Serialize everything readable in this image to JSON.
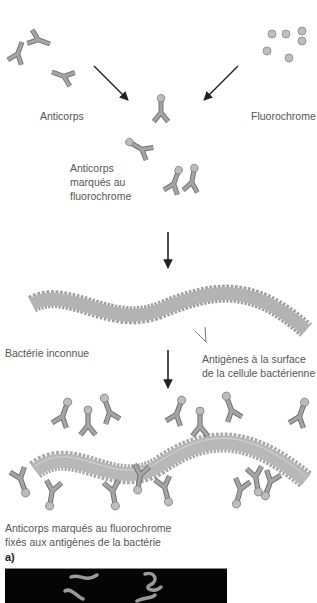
{
  "labels": {
    "antibodies": "Anticorps",
    "fluorochrome": "Fluorochrome",
    "labeled_antibodies_line1": "Anticorps",
    "labeled_antibodies_line2": "marqués au",
    "labeled_antibodies_line3": "fluorochrome",
    "unknown_bacterium": "Bactérie inconnue",
    "antigens_line1": "Antigènes à la surface",
    "antigens_line2": "de la cellule bactérienne",
    "bound_line1": "Anticorps marqués au fluorochrome",
    "bound_line2": "fixés aux antigènes de la bactérie",
    "panel": "a)"
  },
  "colors": {
    "antibody": "#9a9a9a",
    "antibody_stroke": "#6f6f6f",
    "fluorochrome": "#b8b8b8",
    "bacterium": "#b0b0b0",
    "arrow": "#222222",
    "photo_bg": "#050505",
    "photo_glow": "#9a9a9a"
  },
  "icons": {
    "antibody": "antibody-y-shape-icon",
    "fluorochrome": "fluorochrome-dot-icon",
    "arrow": "arrow-down-icon",
    "bacterium": "wavy-bacterium-icon"
  }
}
